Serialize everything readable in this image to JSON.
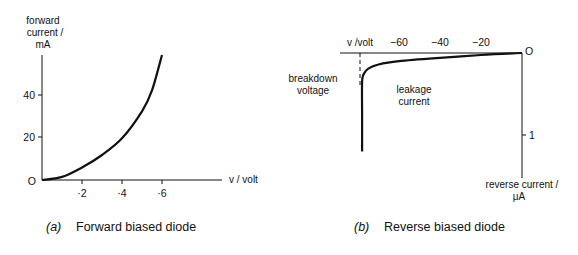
{
  "figure": {
    "panel_a": {
      "caption_letter": "(a)",
      "caption": "Forward biased diode",
      "y_label": [
        "forward",
        "current /",
        "mA"
      ],
      "x_label": "v / volt",
      "origin": "O",
      "y_ticks": [
        "40",
        "20"
      ],
      "x_ticks": [
        "·2",
        "·4",
        "·6"
      ]
    },
    "panel_b": {
      "caption_letter": "(b)",
      "caption": "Reverse biased diode",
      "x_label": "v /volt",
      "x_ticks": [
        "−60",
        "−40",
        "−20"
      ],
      "origin": "O",
      "y_ticks": [
        "1"
      ],
      "y_label": [
        "reverse current /",
        "μA"
      ],
      "annotation_breakdown": [
        "breakdown",
        "voltage"
      ],
      "annotation_leakage": [
        "leakage",
        "current"
      ]
    }
  },
  "chart_data": [
    {
      "type": "line",
      "title": "Forward biased diode",
      "xlabel": "v / volt",
      "ylabel": "forward current / mA",
      "xlim": [
        0,
        0.9
      ],
      "ylim": [
        0,
        60
      ],
      "x_ticks": [
        0.2,
        0.4,
        0.6
      ],
      "y_ticks": [
        20,
        40
      ],
      "grid": false,
      "series": [
        {
          "name": "forward current",
          "x": [
            0,
            0.1,
            0.2,
            0.3,
            0.4,
            0.5,
            0.55,
            0.6
          ],
          "y": [
            0,
            1.5,
            6,
            12,
            20,
            33,
            43,
            60
          ]
        }
      ]
    },
    {
      "type": "line",
      "title": "Reverse biased diode",
      "xlabel": "v /volt",
      "ylabel": "reverse current / μA",
      "xlim": [
        -88,
        0
      ],
      "ylim": [
        0,
        3
      ],
      "x_ticks": [
        -60,
        -40,
        -20
      ],
      "y_ticks": [
        1
      ],
      "grid": false,
      "annotations": [
        "breakdown voltage",
        "leakage current"
      ],
      "breakdown_voltage": -78,
      "series": [
        {
          "name": "reverse current",
          "x": [
            0,
            -20,
            -40,
            -60,
            -70,
            -75,
            -77,
            -78,
            -78,
            -78
          ],
          "y": [
            0,
            0.05,
            0.12,
            0.2,
            0.28,
            0.38,
            0.5,
            0.7,
            1.5,
            2.4
          ]
        }
      ]
    }
  ]
}
